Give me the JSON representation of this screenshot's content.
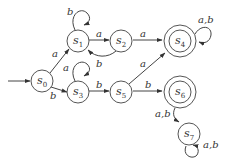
{
  "diagram": {
    "type": "finite-state-automaton",
    "start_state": "s0",
    "states": [
      {
        "id": "s0",
        "name": "s",
        "sub": "0",
        "accepting": false
      },
      {
        "id": "s1",
        "name": "s",
        "sub": "1",
        "accepting": false
      },
      {
        "id": "s2",
        "name": "s",
        "sub": "2",
        "accepting": false
      },
      {
        "id": "s3",
        "name": "s",
        "sub": "3",
        "accepting": false
      },
      {
        "id": "s4",
        "name": "s",
        "sub": "4",
        "accepting": true
      },
      {
        "id": "s5",
        "name": "s",
        "sub": "5",
        "accepting": false
      },
      {
        "id": "s6",
        "name": "s",
        "sub": "6",
        "accepting": true
      },
      {
        "id": "s7",
        "name": "s",
        "sub": "7",
        "accepting": false
      }
    ],
    "transitions": [
      {
        "from": "s0",
        "to": "s1",
        "label": "a"
      },
      {
        "from": "s0",
        "to": "s3",
        "label": "b"
      },
      {
        "from": "s1",
        "to": "s1",
        "label": "b"
      },
      {
        "from": "s1",
        "to": "s2",
        "label": "a"
      },
      {
        "from": "s2",
        "to": "s1",
        "label": "b"
      },
      {
        "from": "s2",
        "to": "s4",
        "label": "a"
      },
      {
        "from": "s3",
        "to": "s3",
        "label": "a"
      },
      {
        "from": "s3",
        "to": "s5",
        "label": "b"
      },
      {
        "from": "s4",
        "to": "s4",
        "label": "a,b"
      },
      {
        "from": "s5",
        "to": "s4",
        "label": "a"
      },
      {
        "from": "s5",
        "to": "s6",
        "label": "b"
      },
      {
        "from": "s6",
        "to": "s7",
        "label": "a,b"
      },
      {
        "from": "s7",
        "to": "s7",
        "label": "a,b"
      }
    ]
  }
}
